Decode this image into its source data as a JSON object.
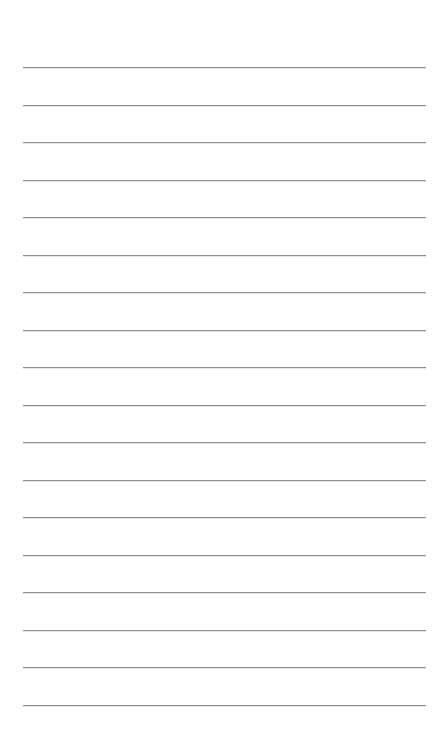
{
  "page": {
    "type": "ruled-paper",
    "background": "#ffffff",
    "line_color": "#8f8f8f",
    "line_count": 18,
    "first_line_y": 67,
    "line_spacing": 37.5,
    "line_left": 23,
    "line_width": 403
  }
}
